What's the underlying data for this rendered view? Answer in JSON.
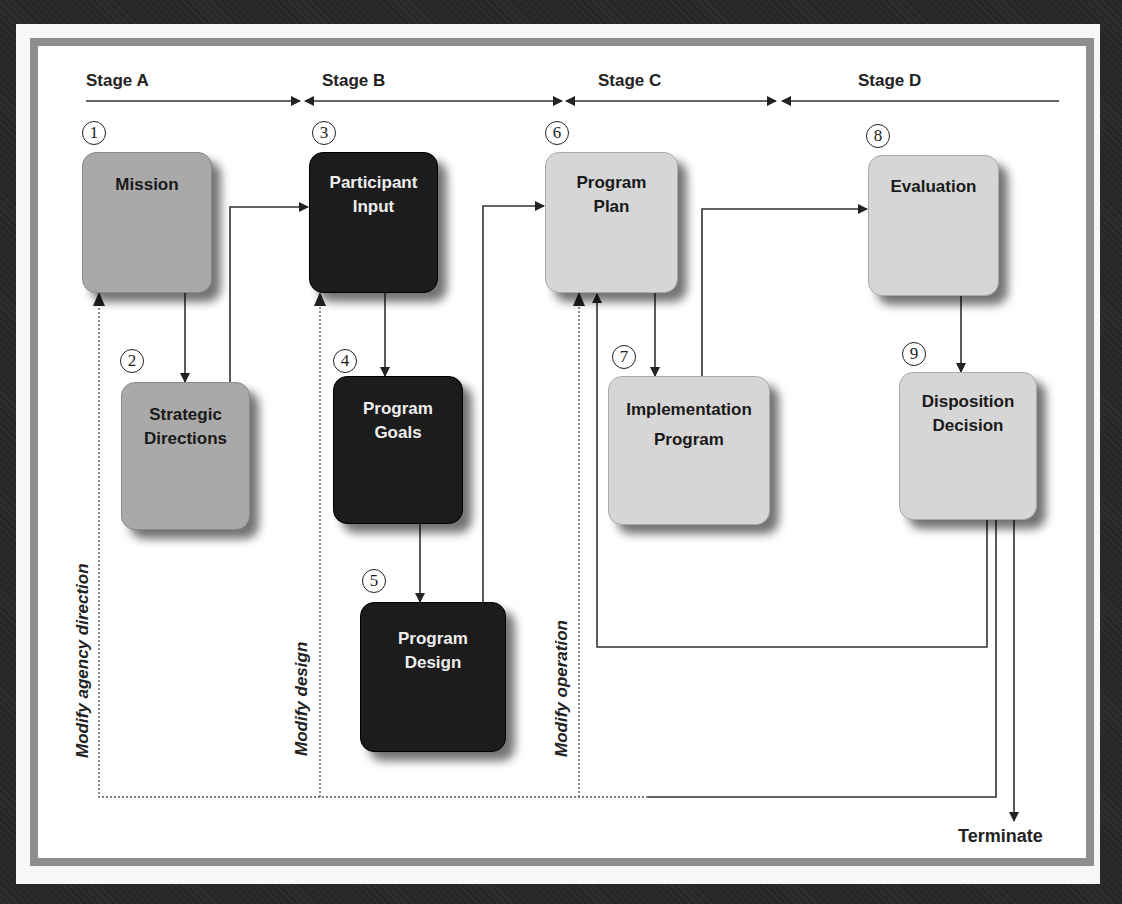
{
  "stages": [
    {
      "label": "Stage A"
    },
    {
      "label": "Stage B"
    },
    {
      "label": "Stage C"
    },
    {
      "label": "Stage D"
    }
  ],
  "nodes": [
    {
      "num": "1",
      "label_line1": "Mission",
      "label_line2": "",
      "shade": "mid"
    },
    {
      "num": "2",
      "label_line1": "Strategic",
      "label_line2": "Directions",
      "shade": "mid"
    },
    {
      "num": "3",
      "label_line1": "Participant",
      "label_line2": "Input",
      "shade": "dark"
    },
    {
      "num": "4",
      "label_line1": "Program",
      "label_line2": "Goals",
      "shade": "dark"
    },
    {
      "num": "5",
      "label_line1": "Program",
      "label_line2": "Design",
      "shade": "dark"
    },
    {
      "num": "6",
      "label_line1": "Program",
      "label_line2": "Plan",
      "shade": "light"
    },
    {
      "num": "7",
      "label_line1": "Implementation",
      "label_line2": "Program",
      "shade": "light"
    },
    {
      "num": "8",
      "label_line1": "Evaluation",
      "label_line2": "",
      "shade": "light"
    },
    {
      "num": "9",
      "label_line1": "Disposition",
      "label_line2": "Decision",
      "shade": "light"
    }
  ],
  "feedback_labels": {
    "agency": "Modify agency direction",
    "design": "Modify design",
    "operation": "Modify operation"
  },
  "terminal": {
    "label": "Terminate"
  },
  "colors": {
    "mid": "#a9a9a9",
    "dark": "#1c1c1c",
    "light": "#d6d6d6",
    "frame": "#8e8e8e"
  }
}
